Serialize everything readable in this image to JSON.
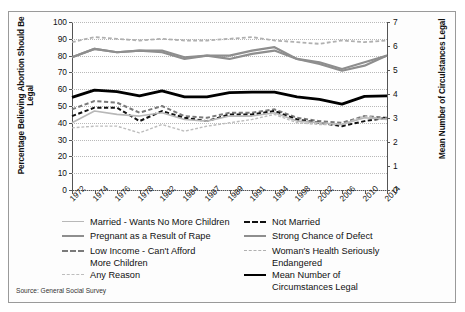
{
  "source_note": "Source: General Social Survey",
  "axes": {
    "left_title": "Percentage Believing Abortion Should Be Legal",
    "right_title": "Mean Number of Circulstances Legal",
    "left_ticks": [
      "100",
      "90",
      "80",
      "70",
      "60",
      "50",
      "40",
      "30",
      "20",
      "10",
      "0"
    ],
    "right_ticks": [
      "7",
      "6",
      "5",
      "4",
      "3",
      "2",
      "1",
      "0"
    ],
    "x_ticks": [
      "1972",
      "1974",
      "1976",
      "1978",
      "1982",
      "1984",
      "1987",
      "1989",
      "1991",
      "1994",
      "1998",
      "2002",
      "2006",
      "2010",
      "2014"
    ]
  },
  "legend": {
    "left_column": [
      {
        "label": "Married - Wants No More Children",
        "style": "solid",
        "color": "#b8b8b8",
        "width": 1.6
      },
      {
        "label": "Pregnant as a Result of Rape",
        "style": "solid",
        "color": "#8e8e8e",
        "width": 2.2
      },
      {
        "label": "Low Income - Can't Afford",
        "label2": "More Children",
        "style": "dashed",
        "color": "#7a7a7a",
        "width": 2.0
      },
      {
        "label": "Any Reason",
        "style": "dashed",
        "color": "#bdbdbd",
        "width": 1.4
      }
    ],
    "right_column": [
      {
        "label": "Not Married",
        "style": "dashed",
        "color": "#111111",
        "width": 2.0
      },
      {
        "label": "Strong Chance of Defect",
        "style": "solid",
        "color": "#8e8e8e",
        "width": 2.2
      },
      {
        "label": "Woman's Health Seriously",
        "label2": "Endangered",
        "style": "dashed",
        "color": "#b0b0b0",
        "width": 1.8
      },
      {
        "label": "Mean Number of",
        "label2": "Circumstances Legal",
        "style": "solid",
        "color": "#000000",
        "width": 2.8
      }
    ]
  },
  "chart_data": {
    "type": "line",
    "title": "",
    "xlabel": "",
    "ylabel": "Percentage Believing Abortion Should Be Legal",
    "y2label": "Mean Number of Circulstances Legal",
    "ylim": [
      0,
      100
    ],
    "y2lim": [
      0,
      7
    ],
    "grid": true,
    "legend_position": "below",
    "x": [
      "1972",
      "1974",
      "1976",
      "1978",
      "1982",
      "1984",
      "1987",
      "1989",
      "1991",
      "1994",
      "1998",
      "2002",
      "2006",
      "2010",
      "2014"
    ],
    "series": [
      {
        "name": "Woman's Health Seriously Endangered",
        "axis": "left",
        "color": "#b0b0b0",
        "style": "dashed",
        "width": 1.8,
        "values": [
          88,
          91,
          90,
          89,
          90,
          89,
          89,
          90,
          91,
          89,
          88,
          87,
          89,
          88,
          89
        ]
      },
      {
        "name": "Strong Chance of Defect",
        "axis": "left",
        "color": "#8e8e8e",
        "style": "solid",
        "width": 2.2,
        "values": [
          79,
          84,
          82,
          83,
          82,
          78,
          80,
          78,
          81,
          83,
          78,
          75,
          71,
          74,
          80
        ]
      },
      {
        "name": "Pregnant as a Result of Rape",
        "axis": "left",
        "color": "#8e8e8e",
        "style": "solid",
        "width": 2.2,
        "values": [
          79,
          84,
          82,
          83,
          83,
          79,
          80,
          80,
          83,
          85,
          78,
          76,
          72,
          76,
          80
        ]
      },
      {
        "name": "Low Income - Can't Afford More Children",
        "axis": "left",
        "color": "#7a7a7a",
        "style": "dashed",
        "width": 2.0,
        "values": [
          48,
          53,
          52,
          46,
          50,
          44,
          43,
          46,
          46,
          48,
          43,
          41,
          40,
          44,
          43
        ]
      },
      {
        "name": "Not Married",
        "axis": "left",
        "color": "#111111",
        "style": "dashed",
        "width": 2.0,
        "values": [
          44,
          49,
          49,
          41,
          47,
          43,
          41,
          45,
          45,
          47,
          42,
          40,
          38,
          41,
          43
        ]
      },
      {
        "name": "Married - Wants No More Children",
        "axis": "left",
        "color": "#b8b8b8",
        "style": "solid",
        "width": 1.6,
        "values": [
          40,
          47,
          45,
          44,
          46,
          42,
          41,
          44,
          44,
          46,
          41,
          40,
          39,
          43,
          42
        ]
      },
      {
        "name": "Any Reason",
        "axis": "left",
        "color": "#bdbdbd",
        "style": "dashed",
        "width": 1.4,
        "values": [
          37,
          38,
          38,
          34,
          39,
          35,
          38,
          40,
          42,
          45,
          40,
          39,
          39,
          44,
          42
        ]
      },
      {
        "name": "Mean Number of Circumstances Legal",
        "axis": "right",
        "color": "#000000",
        "style": "solid",
        "width": 2.8,
        "values": [
          3.86,
          4.16,
          4.1,
          3.92,
          4.13,
          3.88,
          3.88,
          4.06,
          4.08,
          4.08,
          3.88,
          3.78,
          3.58,
          3.9,
          3.92
        ]
      }
    ]
  }
}
